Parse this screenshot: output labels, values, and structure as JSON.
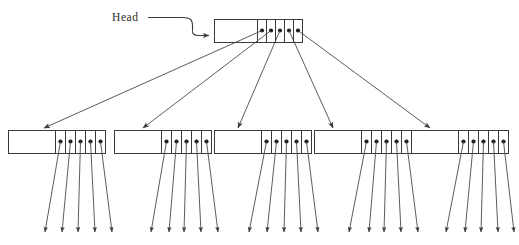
{
  "diagram": {
    "kind": "node-pointer-tree",
    "head_label": "Head",
    "colors": {
      "stroke": "#3a3a3a",
      "edge": "#4a4a4a",
      "dot": "#1c1c1c",
      "background": "#ffffff"
    },
    "root": {
      "name": "root-node",
      "data_cell_label": "",
      "pointer_count": 5,
      "pointer_labels": [
        "",
        "",
        "",
        "",
        ""
      ]
    },
    "children": [
      {
        "name": "child-node-1",
        "data_cell_label": "",
        "pointer_count": 5,
        "leaf_arrow_count": 5,
        "pointer_labels": [
          "",
          "",
          "",
          "",
          ""
        ]
      },
      {
        "name": "child-node-2",
        "data_cell_label": "",
        "pointer_count": 5,
        "leaf_arrow_count": 5,
        "pointer_labels": [
          "",
          "",
          "",
          "",
          ""
        ]
      },
      {
        "name": "child-node-3",
        "data_cell_label": "",
        "pointer_count": 5,
        "leaf_arrow_count": 5,
        "pointer_labels": [
          "",
          "",
          "",
          "",
          ""
        ]
      },
      {
        "name": "child-node-4",
        "data_cell_label": "",
        "pointer_count": 5,
        "leaf_arrow_count": 5,
        "pointer_labels": [
          "",
          "",
          "",
          "",
          ""
        ]
      },
      {
        "name": "child-node-5",
        "data_cell_label": "",
        "pointer_count": 5,
        "leaf_arrow_count": 5,
        "pointer_labels": [
          "",
          "",
          "",
          "",
          ""
        ]
      }
    ]
  }
}
